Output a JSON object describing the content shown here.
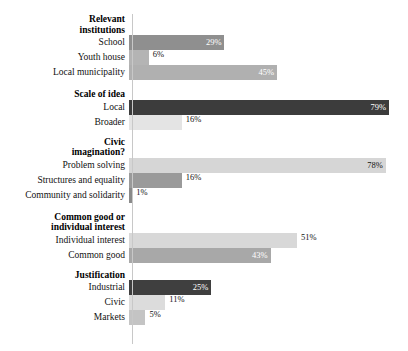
{
  "chart_data": {
    "type": "bar",
    "orientation": "horizontal",
    "title": "",
    "xlabel": "",
    "ylabel": "",
    "xlim": [
      0,
      100
    ],
    "value_suffix": "%",
    "grid": false,
    "legend": "none",
    "axis_tick_labels": [],
    "groups": [
      {
        "header": "Relevant institutions",
        "header_lines": [
          "Relevant",
          "institutions"
        ],
        "categories": [
          "School",
          "Youth house",
          "Local municipality"
        ],
        "values": [
          29,
          6,
          45
        ],
        "value_labels": [
          "29%",
          "6%",
          "45%"
        ],
        "colors": [
          "#8f8f8f",
          "#b4b4b4",
          "#b0b0b0"
        ],
        "label_placement": [
          "inside",
          "outside",
          "inside"
        ]
      },
      {
        "header": "Scale of idea",
        "header_lines": [
          "Scale of idea"
        ],
        "categories": [
          "Local",
          "Broader"
        ],
        "values": [
          79,
          16
        ],
        "value_labels": [
          "79%",
          "16%"
        ],
        "colors": [
          "#3c3c3c",
          "#e4e4e4"
        ],
        "label_placement": [
          "inside",
          "outside"
        ]
      },
      {
        "header": "Civic imagination?",
        "header_lines": [
          "Civic",
          "imagination?"
        ],
        "categories": [
          "Problem solving",
          "Structures and equality",
          "Community and solidarity"
        ],
        "values": [
          78,
          16,
          1
        ],
        "value_labels": [
          "78%",
          "16%",
          "1%"
        ],
        "colors": [
          "#d6d6d6",
          "#9a9a9a",
          "#8a8a8a"
        ],
        "label_placement": [
          "inside-dark",
          "outside",
          "outside"
        ]
      },
      {
        "header": "Common good or individual interest",
        "header_lines": [
          "Common good or",
          "individual interest"
        ],
        "categories": [
          "Individual interest",
          "Common good"
        ],
        "values": [
          51,
          43
        ],
        "value_labels": [
          "51%",
          "43%"
        ],
        "colors": [
          "#d8d8d8",
          "#a8a8a8"
        ],
        "label_placement": [
          "outside",
          "inside"
        ]
      },
      {
        "header": "Justification",
        "header_lines": [
          "Justification"
        ],
        "categories": [
          "Industrial",
          "Civic",
          "Markets"
        ],
        "values": [
          25,
          11,
          5
        ],
        "value_labels": [
          "25%",
          "11%",
          "5%"
        ],
        "colors": [
          "#3f3f3f",
          "#dcdcdc",
          "#c4c4c4"
        ],
        "label_placement": [
          "inside",
          "outside",
          "outside"
        ]
      }
    ]
  },
  "colors": {
    "background": "#ffffff",
    "text": "#111111",
    "axis": "#c8c8c8",
    "bar_dark": "#3c3c3c",
    "bar_mid": "#9a9a9a",
    "bar_light": "#d6d6d6"
  }
}
